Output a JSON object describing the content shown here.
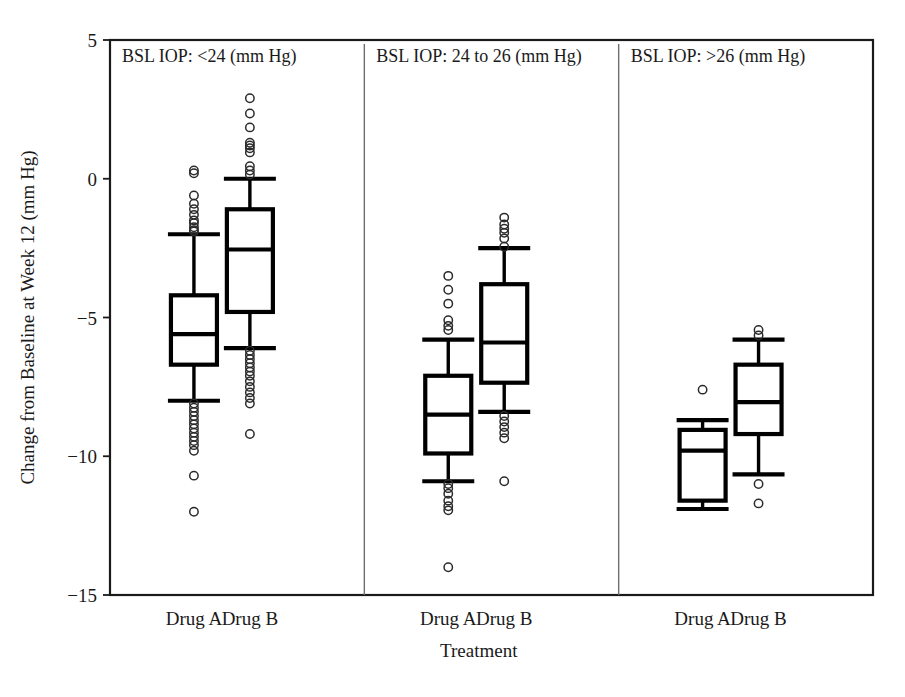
{
  "chart_data": {
    "type": "box",
    "title": "",
    "xlabel": "Treatment",
    "ylabel": "Change from Baseline at Week 12 (mm Hg)",
    "ylim": [
      -15,
      5
    ],
    "yticks": [
      5,
      0,
      -5,
      -10,
      -15
    ],
    "yticklabels": [
      "5",
      "0",
      "−5",
      "−10",
      "−15"
    ],
    "grid": false,
    "legend": "none",
    "categories": [
      "Drug A",
      "Drug B"
    ],
    "panels": [
      {
        "label": "BSL IOP: <24 (mm Hg)",
        "boxes": [
          {
            "name": "Drug A",
            "whisker_high": -2.0,
            "q3": -4.2,
            "median": -5.6,
            "q1": -6.7,
            "whisker_low": -8.0,
            "outliers_high": [
              0.3,
              0.2,
              -0.6,
              -0.9,
              -1.1,
              -1.3,
              -1.5,
              -1.6,
              -1.75,
              -1.85,
              -1.9
            ],
            "outliers_low": [
              -8.1,
              -8.25,
              -8.4,
              -8.55,
              -8.7,
              -8.85,
              -9.0,
              -9.15,
              -9.3,
              -9.45,
              -9.6,
              -9.8,
              -10.7,
              -12.0
            ]
          },
          {
            "name": "Drug B",
            "whisker_high": 0.0,
            "q3": -1.1,
            "median": -2.55,
            "q1": -4.8,
            "whisker_low": -6.1,
            "outliers_high": [
              2.9,
              2.35,
              1.85,
              1.3,
              1.2,
              1.1,
              0.95,
              0.45,
              0.3,
              0.15
            ],
            "outliers_low": [
              -6.2,
              -6.35,
              -6.5,
              -6.65,
              -6.8,
              -6.95,
              -7.1,
              -7.3,
              -7.5,
              -7.7,
              -7.9,
              -8.1,
              -9.2
            ]
          }
        ]
      },
      {
        "label": "BSL IOP: 24 to 26 (mm Hg)",
        "boxes": [
          {
            "name": "Drug A",
            "whisker_high": -5.8,
            "q3": -7.1,
            "median": -8.5,
            "q1": -9.9,
            "whisker_low": -10.9,
            "outliers_high": [
              -3.5,
              -4.0,
              -4.5,
              -5.1,
              -5.3,
              -5.45
            ],
            "outliers_low": [
              -11.0,
              -11.15,
              -11.35,
              -11.6,
              -11.8,
              -11.95,
              -14.0
            ]
          },
          {
            "name": "Drug B",
            "whisker_high": -2.5,
            "q3": -3.8,
            "median": -5.9,
            "q1": -7.35,
            "whisker_low": -8.4,
            "outliers_high": [
              -1.4,
              -1.65,
              -1.8,
              -1.95,
              -2.15,
              -2.45
            ],
            "outliers_low": [
              -8.55,
              -8.75,
              -8.95,
              -9.15,
              -9.35,
              -10.9
            ]
          }
        ]
      },
      {
        "label": "BSL IOP: >26 (mm Hg)",
        "boxes": [
          {
            "name": "Drug A",
            "whisker_high": -8.7,
            "q3": -9.05,
            "median": -9.8,
            "q1": -11.6,
            "whisker_low": -11.9,
            "outliers_high": [
              -7.6
            ],
            "outliers_low": []
          },
          {
            "name": "Drug B",
            "whisker_high": -5.8,
            "q3": -6.7,
            "median": -8.05,
            "q1": -9.2,
            "whisker_low": -10.65,
            "outliers_high": [
              -5.45,
              -5.65
            ],
            "outliers_low": [
              -11.0,
              -11.7
            ]
          }
        ]
      }
    ]
  }
}
